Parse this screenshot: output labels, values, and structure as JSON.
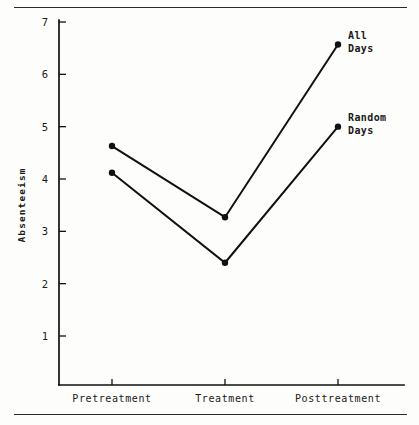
{
  "chart_data": {
    "type": "line",
    "title": "",
    "xlabel": "",
    "ylabel": "Absenteeism",
    "categories": [
      "Pretreatment",
      "Treatment",
      "Posttreatment"
    ],
    "ylim": [
      0,
      7
    ],
    "yticks": [
      1,
      2,
      3,
      4,
      5,
      6,
      7
    ],
    "ytick_labels": [
      "1",
      "2",
      "3",
      "4",
      "5",
      "6",
      "7"
    ],
    "grid": false,
    "legend_position": "inline-right-of-endpoints",
    "series": [
      {
        "name": "All Days",
        "label_lines": [
          "All",
          "Days"
        ],
        "values": [
          4.63,
          3.27,
          6.57
        ]
      },
      {
        "name": "Random Days",
        "label_lines": [
          "Random",
          "Days"
        ],
        "values": [
          4.12,
          2.4,
          5.0
        ]
      }
    ],
    "colors": {
      "line": "#111111",
      "marker": "#111111",
      "axis": "#111111",
      "background": "#fdfdfc",
      "rule": "#2a2a2a"
    }
  },
  "figure": {
    "top_rule": "horizontal-rule",
    "bottom_rule": "horizontal-rule"
  }
}
